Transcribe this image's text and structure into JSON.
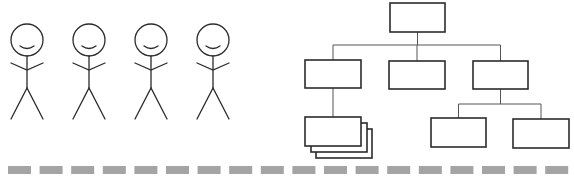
{
  "diagram": {
    "type": "people-and-org-chart",
    "colors": {
      "line": "#2b2b2b",
      "connector": "#555555",
      "dash": "#a4a4a4",
      "background": "#ffffff"
    },
    "people": [
      {
        "id": "person-1",
        "cx": 27
      },
      {
        "id": "person-2",
        "cx": 89
      },
      {
        "id": "person-3",
        "cx": 151
      },
      {
        "id": "person-4",
        "cx": 213
      }
    ],
    "org_chart": {
      "nodes": [
        {
          "id": "root",
          "x": 390,
          "y": 3,
          "w": 55,
          "h": 29,
          "label": ""
        },
        {
          "id": "child-left",
          "x": 305,
          "y": 60,
          "w": 56,
          "h": 28,
          "label": ""
        },
        {
          "id": "child-center",
          "x": 389,
          "y": 61,
          "w": 56,
          "h": 28,
          "label": ""
        },
        {
          "id": "child-right",
          "x": 473,
          "y": 61,
          "w": 55,
          "h": 28,
          "label": ""
        },
        {
          "id": "grandchild-stack",
          "x": 305,
          "y": 117,
          "w": 56,
          "h": 29,
          "label": "",
          "stacked": 3
        },
        {
          "id": "grandchild-right-a",
          "x": 431,
          "y": 118,
          "w": 55,
          "h": 29,
          "label": ""
        },
        {
          "id": "grandchild-right-b",
          "x": 513,
          "y": 119,
          "w": 56,
          "h": 29,
          "label": ""
        }
      ],
      "edges": [
        [
          "root",
          "child-left"
        ],
        [
          "root",
          "child-center"
        ],
        [
          "root",
          "child-right"
        ],
        [
          "child-left",
          "grandchild-stack"
        ],
        [
          "child-right",
          "grandchild-right-a"
        ],
        [
          "child-right",
          "grandchild-right-b"
        ]
      ]
    },
    "divider": {
      "style": "dashed",
      "dash_count": 18,
      "y": 166,
      "height": 8,
      "start_x": 8,
      "period": 31.6,
      "dash_width": 23
    }
  }
}
